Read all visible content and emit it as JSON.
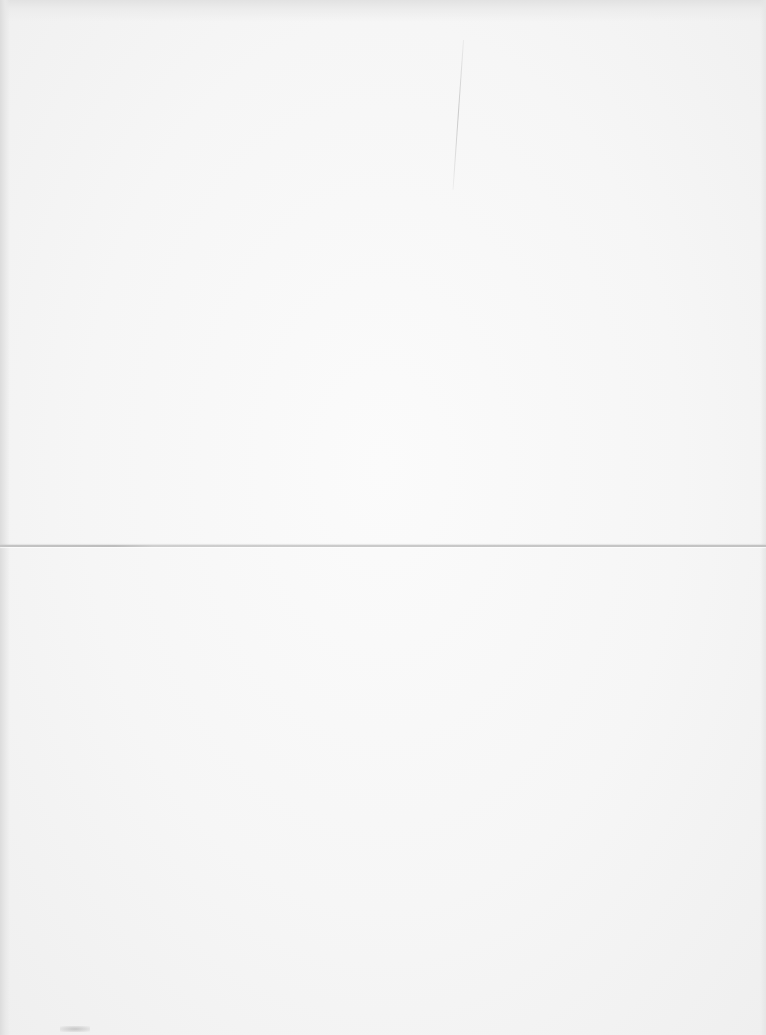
{
  "document": {
    "type": "scanned-page",
    "content_text": "",
    "is_blank": true,
    "features": {
      "fold_line": {
        "orientation": "horizontal",
        "y": 545
      },
      "scratch": {
        "orientation": "vertical",
        "x": 463
      }
    },
    "colors": {
      "paper": "#f6f6f6",
      "fold_line": "#c4c4c4",
      "edge_shading": "#dcdcdc"
    }
  }
}
